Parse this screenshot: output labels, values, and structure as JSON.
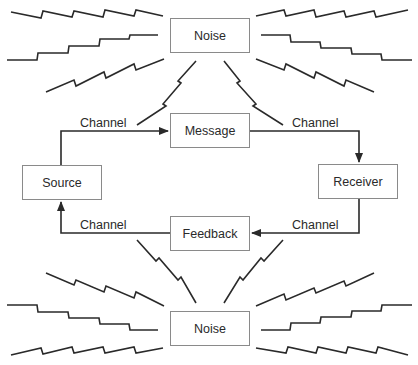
{
  "diagram": {
    "title": "",
    "nodes": [
      {
        "id": "noise_top",
        "label": "Noise",
        "x": 170,
        "y": 18,
        "w": 80,
        "h": 35
      },
      {
        "id": "message",
        "label": "Message",
        "x": 170,
        "y": 113,
        "w": 80,
        "h": 35
      },
      {
        "id": "source",
        "label": "Source",
        "x": 22,
        "y": 165,
        "w": 80,
        "h": 35
      },
      {
        "id": "receiver",
        "label": "Receiver",
        "x": 318,
        "y": 164,
        "w": 80,
        "h": 35
      },
      {
        "id": "feedback",
        "label": "Feedback",
        "x": 170,
        "y": 216,
        "w": 80,
        "h": 35
      },
      {
        "id": "noise_bottom",
        "label": "Noise",
        "x": 170,
        "y": 311,
        "w": 80,
        "h": 35
      }
    ],
    "edges": [
      {
        "from": "source",
        "to": "message",
        "label": "Channel"
      },
      {
        "from": "message",
        "to": "receiver",
        "label": "Channel"
      },
      {
        "from": "receiver",
        "to": "feedback",
        "label": "Channel"
      },
      {
        "from": "feedback",
        "to": "source",
        "label": "Channel"
      }
    ],
    "channel_labels": [
      {
        "text": "Channel",
        "x": 80,
        "y": 116
      },
      {
        "text": "Channel",
        "x": 292,
        "y": 116
      },
      {
        "text": "Channel",
        "x": 80,
        "y": 218
      },
      {
        "text": "Channel",
        "x": 292,
        "y": 218
      }
    ],
    "colors": {
      "line": "#2a2a2a",
      "box_border": "#8a8a8a",
      "text": "#2a2a2a"
    }
  }
}
